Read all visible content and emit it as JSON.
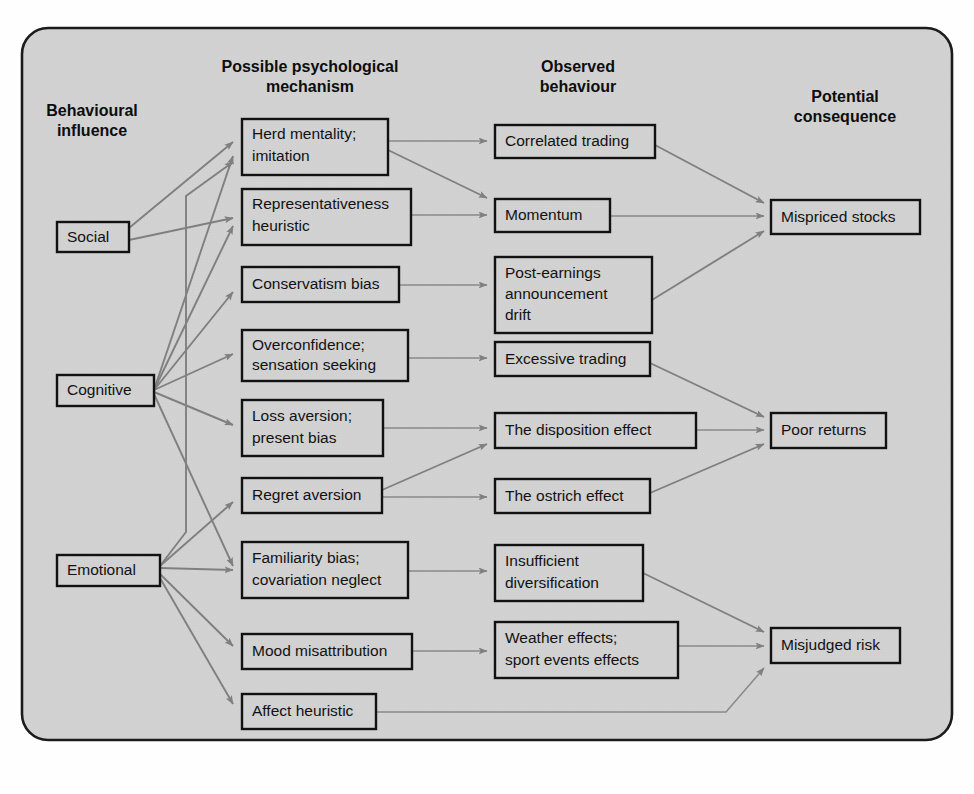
{
  "figure": {
    "background_color": "#d2d2d2",
    "panel_border_color": "#1b1b1b",
    "box_fill_color": "#d2d2d2",
    "box_border_color": "#111111",
    "arrow_color": "#808080"
  },
  "columns": [
    {
      "id": "influence",
      "header": "Behavioural\ninfluence",
      "header_line1": "Behavioural",
      "header_line2": "influence"
    },
    {
      "id": "mechanism",
      "header": "Possible psychological\nmechanism",
      "header_line1": "Possible psychological",
      "header_line2": "mechanism"
    },
    {
      "id": "behaviour",
      "header": "Observed\nbehaviour",
      "header_line1": "Observed",
      "header_line2": "behaviour"
    },
    {
      "id": "consequence",
      "header": "Potential\nconsequence",
      "header_line1": "Potential",
      "header_line2": "consequence"
    }
  ],
  "influences": [
    {
      "id": "social",
      "label": "Social"
    },
    {
      "id": "cognitive",
      "label": "Cognitive"
    },
    {
      "id": "emotional",
      "label": "Emotional"
    }
  ],
  "mechanisms": [
    {
      "id": "herd",
      "line1": "Herd mentality;",
      "line2": "imitation"
    },
    {
      "id": "representativeness",
      "line1": "Representativeness",
      "line2": "heuristic"
    },
    {
      "id": "conservatism",
      "line1": "Conservatism bias",
      "line2": ""
    },
    {
      "id": "overconfidence",
      "line1": "Overconfidence;",
      "line2": "sensation seeking"
    },
    {
      "id": "lossaversion",
      "line1": "Loss aversion;",
      "line2": "present bias"
    },
    {
      "id": "regret",
      "line1": "Regret aversion",
      "line2": ""
    },
    {
      "id": "familiarity",
      "line1": "Familiarity bias;",
      "line2": "covariation neglect"
    },
    {
      "id": "mood",
      "line1": "Mood misattribution",
      "line2": ""
    },
    {
      "id": "affect",
      "line1": "Affect heuristic",
      "line2": ""
    }
  ],
  "behaviours": [
    {
      "id": "correlated",
      "line1": "Correlated trading",
      "line2": "",
      "line3": ""
    },
    {
      "id": "momentum",
      "line1": "Momentum",
      "line2": "",
      "line3": ""
    },
    {
      "id": "pead",
      "line1": "Post-earnings",
      "line2": "announcement",
      "line3": "drift"
    },
    {
      "id": "excessive",
      "line1": "Excessive trading",
      "line2": "",
      "line3": ""
    },
    {
      "id": "disposition",
      "line1": "The disposition effect",
      "line2": "",
      "line3": ""
    },
    {
      "id": "ostrich",
      "line1": "The ostrich effect",
      "line2": "",
      "line3": ""
    },
    {
      "id": "insufficient",
      "line1": "Insufficient",
      "line2": "diversification",
      "line3": ""
    },
    {
      "id": "weather",
      "line1": "Weather effects;",
      "line2": "sport events effects",
      "line3": ""
    }
  ],
  "consequences": [
    {
      "id": "mispriced",
      "label": "Mispriced stocks"
    },
    {
      "id": "poor",
      "label": "Poor returns"
    },
    {
      "id": "misjudged",
      "label": "Misjudged risk"
    }
  ],
  "links": [
    {
      "from": "social",
      "to": "herd"
    },
    {
      "from": "social",
      "to": "representativeness"
    },
    {
      "from": "cognitive",
      "to": "herd"
    },
    {
      "from": "cognitive",
      "to": "representativeness"
    },
    {
      "from": "cognitive",
      "to": "conservatism"
    },
    {
      "from": "cognitive",
      "to": "overconfidence"
    },
    {
      "from": "cognitive",
      "to": "lossaversion"
    },
    {
      "from": "cognitive",
      "to": "familiarity"
    },
    {
      "from": "emotional",
      "to": "herd"
    },
    {
      "from": "emotional",
      "to": "regret"
    },
    {
      "from": "emotional",
      "to": "familiarity"
    },
    {
      "from": "emotional",
      "to": "mood"
    },
    {
      "from": "emotional",
      "to": "affect"
    },
    {
      "from": "herd",
      "to": "correlated"
    },
    {
      "from": "herd",
      "to": "momentum"
    },
    {
      "from": "representativeness",
      "to": "momentum"
    },
    {
      "from": "conservatism",
      "to": "pead"
    },
    {
      "from": "overconfidence",
      "to": "excessive"
    },
    {
      "from": "lossaversion",
      "to": "disposition"
    },
    {
      "from": "regret",
      "to": "disposition"
    },
    {
      "from": "regret",
      "to": "ostrich"
    },
    {
      "from": "familiarity",
      "to": "insufficient"
    },
    {
      "from": "mood",
      "to": "weather"
    },
    {
      "from": "affect",
      "to": "misjudged"
    },
    {
      "from": "correlated",
      "to": "mispriced"
    },
    {
      "from": "momentum",
      "to": "mispriced"
    },
    {
      "from": "pead",
      "to": "mispriced"
    },
    {
      "from": "excessive",
      "to": "poor"
    },
    {
      "from": "disposition",
      "to": "poor"
    },
    {
      "from": "ostrich",
      "to": "poor"
    },
    {
      "from": "insufficient",
      "to": "misjudged"
    },
    {
      "from": "weather",
      "to": "misjudged"
    }
  ]
}
